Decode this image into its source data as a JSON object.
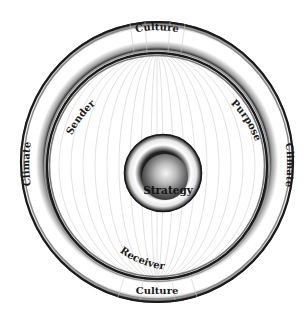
{
  "diagram": {
    "type": "concentric-circles",
    "outer_ring": {
      "labels": {
        "top": "Culture",
        "bottom": "Culture",
        "left": "Climate",
        "right": "Climate"
      }
    },
    "inner_ring": {
      "labels": {
        "upper_left": "Sender",
        "upper_right": "Purpose",
        "lower_left": "Receiver"
      }
    },
    "core": {
      "label": "Strategy"
    },
    "colors": {
      "ring_stroke": "#1a1a1a",
      "meridian": "#c9c9c9",
      "sphere_dark": "#2e2e2e",
      "sphere_light": "#f2f2f2",
      "background": "#ffffff"
    }
  }
}
